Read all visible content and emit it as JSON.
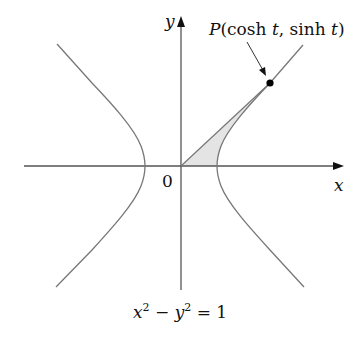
{
  "figure": {
    "type": "hyperbola-diagram",
    "equation": "x² − y² = 1",
    "axes": {
      "x_label": "x",
      "y_label": "y",
      "origin_label": "0"
    },
    "point": {
      "label_prefix": "P",
      "label_coords": "(cosh t, sinh t)",
      "label_full": "P(cosh t, sinh t)"
    },
    "shaded_region": "region bounded by origin ray to P, x-axis, and hyperbola right branch",
    "colors": {
      "axis": "#555555",
      "curve": "#7a7a7a",
      "shade": "#e4e4e4",
      "point": "#000000",
      "text": "#111111"
    }
  }
}
